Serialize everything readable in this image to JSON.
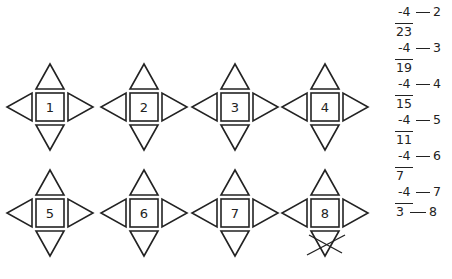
{
  "figures": [
    {
      "label": "1",
      "cx": 50,
      "cy": 107,
      "crossed_bottom": false
    },
    {
      "label": "2",
      "cx": 144,
      "cy": 107,
      "crossed_bottom": false
    },
    {
      "label": "3",
      "cx": 235,
      "cy": 107,
      "crossed_bottom": false
    },
    {
      "label": "4",
      "cx": 325,
      "cy": 107,
      "crossed_bottom": false
    },
    {
      "label": "5",
      "cx": 50,
      "cy": 213,
      "crossed_bottom": false
    },
    {
      "label": "6",
      "cx": 144,
      "cy": 213,
      "crossed_bottom": false
    },
    {
      "label": "7",
      "cx": 235,
      "cy": 213,
      "crossed_bottom": false
    },
    {
      "label": "8",
      "cx": 325,
      "cy": 213,
      "crossed_bottom": true
    }
  ],
  "calculation": {
    "steps": [
      {
        "subtract": "-4",
        "step": "2",
        "result": "23"
      },
      {
        "subtract": "-4",
        "step": "3",
        "result": "19"
      },
      {
        "subtract": "-4",
        "step": "4",
        "result": "15"
      },
      {
        "subtract": "-4",
        "step": "5",
        "result": "11"
      },
      {
        "subtract": "-4",
        "step": "6",
        "result": "7"
      },
      {
        "subtract": "-4",
        "step": "7",
        "result": "3"
      }
    ],
    "final_step": "8"
  }
}
